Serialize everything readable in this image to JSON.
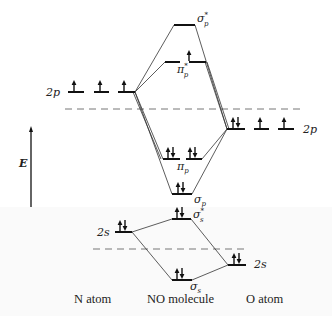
{
  "diagram": {
    "axis": {
      "label": "E",
      "direction": "up"
    },
    "columns": {
      "left": "N atom",
      "center": "NO molecule",
      "right": "O atom"
    },
    "atomic_orbitals": {
      "N_2p": {
        "label": "2p",
        "electrons": [
          1,
          1,
          1
        ]
      },
      "N_2s": {
        "label": "2s",
        "electrons": 2
      },
      "O_2p": {
        "label": "2p",
        "electrons": [
          2,
          1,
          1
        ]
      },
      "O_2s": {
        "label": "2s",
        "electrons": 2
      }
    },
    "molecular_orbitals": [
      {
        "id": "sigma_p_star",
        "symbol": "σ",
        "sub": "p",
        "star": "*",
        "electrons": 0
      },
      {
        "id": "pi_p_star",
        "symbol": "π",
        "sub": "p",
        "star": "*",
        "electrons": [
          0,
          1
        ]
      },
      {
        "id": "pi_p",
        "symbol": "π",
        "sub": "p",
        "star": "",
        "electrons": [
          2,
          2
        ]
      },
      {
        "id": "sigma_p",
        "symbol": "σ",
        "sub": "p",
        "star": "",
        "electrons": 2
      },
      {
        "id": "sigma_s_star",
        "symbol": "σ",
        "sub": "s",
        "star": "*",
        "electrons": 2
      },
      {
        "id": "sigma_s",
        "symbol": "σ",
        "sub": "s",
        "star": "",
        "electrons": 2
      }
    ]
  }
}
